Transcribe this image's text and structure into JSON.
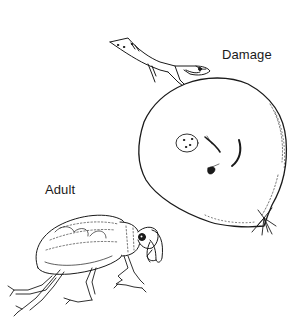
{
  "figure": {
    "labels": {
      "damage": "Damage",
      "adult": "Adult"
    },
    "elements": [
      {
        "name": "twig",
        "icon": "twig-icon"
      },
      {
        "name": "damaged-fruit",
        "icon": "fruit-icon",
        "marks": 4
      },
      {
        "name": "adult-weevil",
        "icon": "weevil-icon"
      }
    ],
    "colors": {
      "background": "#ffffff",
      "ink": "#1a1a1a"
    }
  }
}
